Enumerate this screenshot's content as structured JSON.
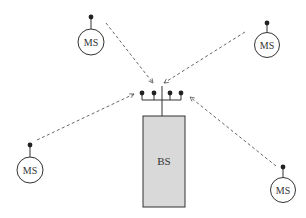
{
  "colors": {
    "line": "#333333",
    "dashed": "#555555",
    "bs_fill": "#d9d9d9",
    "background": "#ffffff"
  },
  "base_station": {
    "label": "BS",
    "antenna_count": 4
  },
  "mobile_stations": [
    {
      "id": "ms-top-left",
      "label": "MS"
    },
    {
      "id": "ms-top-right",
      "label": "MS"
    },
    {
      "id": "ms-bottom-left",
      "label": "MS"
    },
    {
      "id": "ms-bottom-right",
      "label": "MS"
    }
  ],
  "links": [
    {
      "from": "ms-top-left",
      "to": "base_station",
      "style": "dashed-arrow"
    },
    {
      "from": "ms-top-right",
      "to": "base_station",
      "style": "dashed-arrow"
    },
    {
      "from": "ms-bottom-left",
      "to": "base_station",
      "style": "dashed-arrow"
    },
    {
      "from": "ms-bottom-right",
      "to": "base_station",
      "style": "dashed-arrow"
    }
  ]
}
